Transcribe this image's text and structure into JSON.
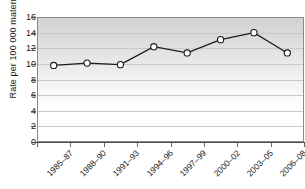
{
  "chart_data": {
    "type": "line",
    "title": "",
    "subtitle": "",
    "xlabel": "",
    "ylabel": "Rate per 100 000 maternities",
    "categories": [
      "1985–87",
      "1988–90",
      "1991–93",
      "1994–96",
      "1997–99",
      "2000–02",
      "2003–05",
      "2006–08"
    ],
    "values": [
      9.8,
      10.1,
      9.9,
      12.2,
      11.4,
      13.1,
      14.0,
      11.4
    ],
    "ylim": [
      0,
      16
    ],
    "ytick_labels": [
      "0",
      "2",
      "4",
      "6",
      "8",
      "10",
      "12",
      "14",
      "16"
    ],
    "ytick_values": [
      0,
      2,
      4,
      6,
      8,
      10,
      12,
      14,
      16
    ],
    "grid": true,
    "legend": "none",
    "marker": "open-circle",
    "line_color": "#1a1a1a",
    "marker_fill": "#ffffff",
    "marker_stroke": "#1a1a1a",
    "plot_bg_top": "#d2d2d2",
    "plot_bg_bottom": "#ffffff",
    "gridline_color": "#c9c9c9",
    "axis_color": "#4a4a4a"
  }
}
